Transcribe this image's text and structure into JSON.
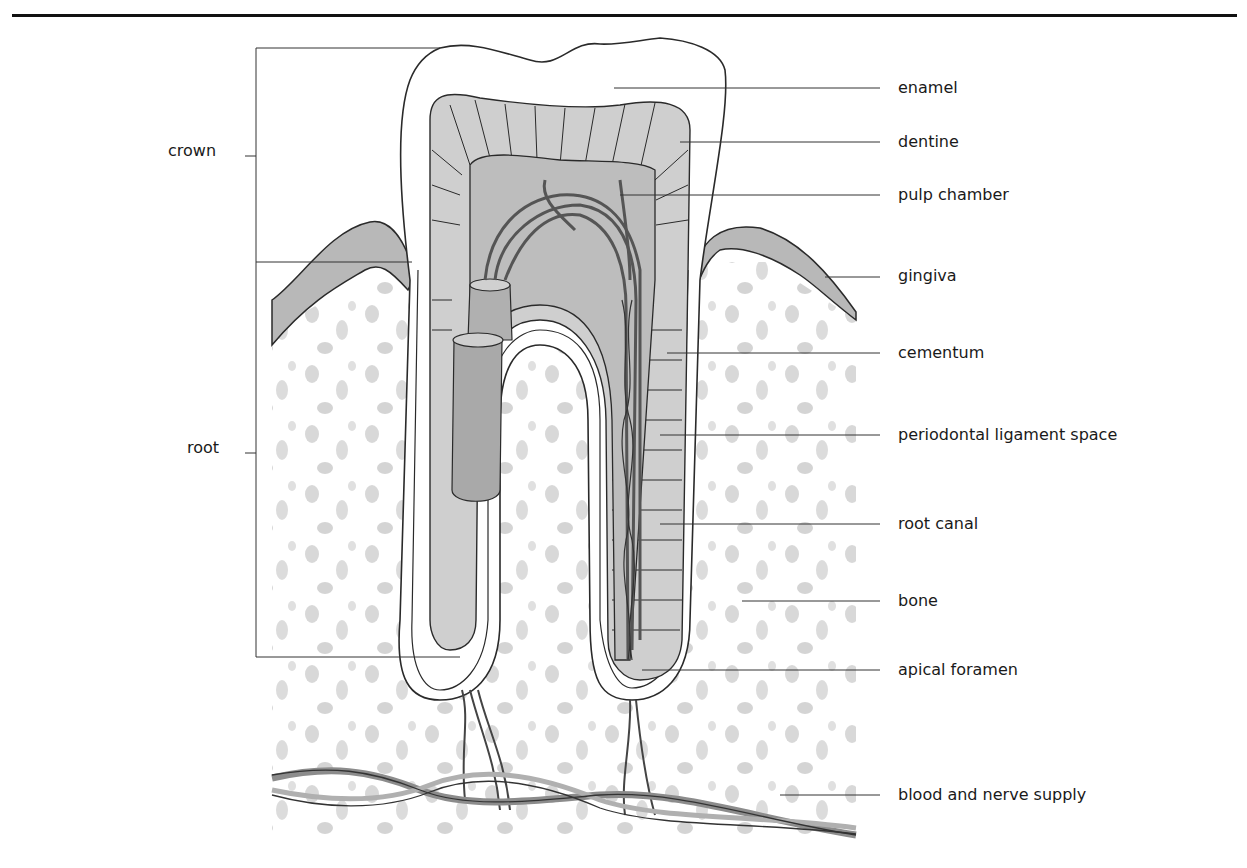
{
  "diagram": {
    "colors": {
      "line": "#2a2a2a",
      "dentine_fill": "#cfcfcf",
      "pulp_fill": "#bdbdbd",
      "gingiva_fill": "#b8b8b8",
      "bone_speckle": "#d6d6d6",
      "vessel_fill": "#a9a9a9",
      "background": "#ffffff"
    },
    "left_labels": [
      {
        "id": "crown",
        "text": "crown"
      },
      {
        "id": "root",
        "text": "root"
      }
    ],
    "right_labels": [
      {
        "id": "enamel",
        "text": "enamel"
      },
      {
        "id": "dentine",
        "text": "dentine"
      },
      {
        "id": "pulp-chamber",
        "text": "pulp chamber"
      },
      {
        "id": "gingiva",
        "text": "gingiva"
      },
      {
        "id": "cementum",
        "text": "cementum"
      },
      {
        "id": "periodontal-ligament-space",
        "text": "periodontal ligament space"
      },
      {
        "id": "root-canal",
        "text": "root canal"
      },
      {
        "id": "bone",
        "text": "bone"
      },
      {
        "id": "apical-foramen",
        "text": "apical foramen"
      },
      {
        "id": "blood-and-nerve-supply",
        "text": "blood and nerve supply"
      }
    ]
  }
}
